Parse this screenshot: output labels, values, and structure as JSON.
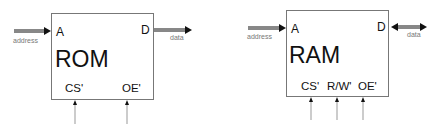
{
  "rom": {
    "title": "ROM",
    "address_pin": "A",
    "data_pin": "D",
    "address_label": "address",
    "data_label": "data",
    "controls": [
      "CS'",
      "OE'"
    ],
    "data_direction": "output"
  },
  "ram": {
    "title": "RAM",
    "address_pin": "A",
    "data_pin": "D",
    "address_label": "address",
    "data_label": "data",
    "controls": [
      "CS'",
      "R/W'",
      "OE'"
    ],
    "data_direction": "bidirectional"
  },
  "colors": {
    "box_border": "#777777",
    "arrow": "#111111",
    "control_line": "#999999",
    "label_gray": "#777777"
  }
}
